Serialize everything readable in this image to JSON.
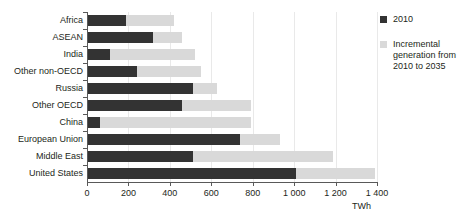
{
  "chart_data": {
    "type": "bar",
    "orientation": "horizontal",
    "stacked": true,
    "title": "",
    "xlabel": "TWh",
    "ylabel": "",
    "xlim": [
      0,
      1400
    ],
    "xticks": [
      0,
      200,
      400,
      600,
      800,
      1000,
      1200,
      1400
    ],
    "xticklabels": [
      "0",
      "200",
      "400",
      "600",
      "800",
      "1 000",
      "1 200",
      "1 400"
    ],
    "grid": true,
    "legend_position": "right",
    "categories": [
      "Africa",
      "ASEAN",
      "India",
      "Other non-OECD",
      "Russia",
      "Other OECD",
      "China",
      "European Union",
      "Middle East",
      "United States"
    ],
    "series": [
      {
        "name": "2010",
        "color": "#333333",
        "values": [
          190,
          320,
          110,
          240,
          510,
          460,
          65,
          740,
          510,
          1010
        ]
      },
      {
        "name": "Incremental generation from 2010 to 2035",
        "color": "#d9d9d9",
        "values": [
          230,
          140,
          410,
          310,
          120,
          330,
          725,
          190,
          680,
          380
        ]
      }
    ],
    "totals": [
      420,
      460,
      520,
      550,
      630,
      790,
      790,
      930,
      1190,
      1390
    ]
  },
  "legend": {
    "items": [
      {
        "label": "2010",
        "swatch": "base"
      },
      {
        "label": "Incremental generation from 2010 to 2035",
        "swatch": "inc"
      }
    ]
  },
  "axis": {
    "unit": "TWh"
  }
}
